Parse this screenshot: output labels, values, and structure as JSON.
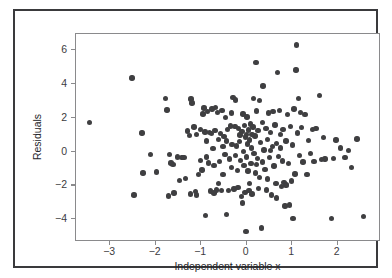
{
  "chart_data": {
    "type": "scatter",
    "title": "",
    "xlabel": "Independent variable x",
    "ylabel": "Residuals",
    "xlim": [
      -3.75,
      2.95
    ],
    "ylim": [
      -5.35,
      6.95
    ],
    "xticks": [
      -3,
      -2,
      -1,
      0,
      1,
      2
    ],
    "xticklabels": [
      "−3",
      "−2",
      "−1",
      "0",
      "1",
      "2"
    ],
    "yticks": [
      -4,
      -2,
      0,
      2,
      4,
      6
    ],
    "yticklabels": [
      "−4",
      "−2",
      "0",
      "2",
      "4",
      "6"
    ],
    "grid": false,
    "legend": null,
    "marker": {
      "shape": "circle",
      "color": "#3f3f41",
      "size_px": 5.4
    },
    "series": [
      {
        "name": "Residuals",
        "points": [
          [
            -3.45,
            1.72
          ],
          [
            -2.52,
            4.35
          ],
          [
            -2.48,
            -2.57
          ],
          [
            -2.3,
            1.1
          ],
          [
            -2.28,
            -1.28
          ],
          [
            -2.12,
            -0.16
          ],
          [
            -1.78,
            3.15
          ],
          [
            -1.75,
            2.45
          ],
          [
            -1.72,
            -2.62
          ],
          [
            -1.7,
            -0.18
          ],
          [
            -1.66,
            -0.68
          ],
          [
            -1.62,
            -0.76
          ],
          [
            -1.6,
            -2.45
          ],
          [
            -1.52,
            -0.32
          ],
          [
            -1.48,
            -1.72
          ],
          [
            -1.42,
            -0.34
          ],
          [
            -1.38,
            -0.35
          ],
          [
            -1.34,
            -1.58
          ],
          [
            -1.3,
            1.22
          ],
          [
            -1.26,
            0.95
          ],
          [
            -1.24,
            -2.52
          ],
          [
            -1.22,
            3.1
          ],
          [
            -1.2,
            2.88
          ],
          [
            -1.16,
            1.45
          ],
          [
            -1.12,
            -2.38
          ],
          [
            -1.1,
            1.0
          ],
          [
            -1.06,
            -1.35
          ],
          [
            -1.02,
            -0.52
          ],
          [
            -0.98,
            -1.1
          ],
          [
            -0.96,
            2.22
          ],
          [
            -0.94,
            2.58
          ],
          [
            -0.92,
            1.16
          ],
          [
            -0.9,
            -3.8
          ],
          [
            -0.88,
            0.62
          ],
          [
            -0.86,
            2.35
          ],
          [
            -0.84,
            -0.68
          ],
          [
            -0.82,
            1.12
          ],
          [
            -0.8,
            -2.34
          ],
          [
            -0.78,
            1.08
          ],
          [
            -0.76,
            2.52
          ],
          [
            -0.74,
            0.18
          ],
          [
            -0.72,
            -0.82
          ],
          [
            -0.7,
            1.26
          ],
          [
            -0.68,
            2.62
          ],
          [
            -0.66,
            -2.28
          ],
          [
            -0.64,
            2.32
          ],
          [
            -0.62,
            0.72
          ],
          [
            -0.6,
            -0.6
          ],
          [
            -0.58,
            1.05
          ],
          [
            -0.56,
            -2.3
          ],
          [
            -0.54,
            2.42
          ],
          [
            -0.52,
            -1.36
          ],
          [
            -0.5,
            0.88
          ],
          [
            -0.48,
            -0.18
          ],
          [
            -0.46,
            2.02
          ],
          [
            -0.44,
            -3.72
          ],
          [
            -0.42,
            1.32
          ],
          [
            -0.4,
            -2.3
          ],
          [
            -0.38,
            -0.45
          ],
          [
            -0.36,
            1.52
          ],
          [
            -0.34,
            -0.95
          ],
          [
            -0.32,
            0.42
          ],
          [
            -0.3,
            3.18
          ],
          [
            -0.28,
            -2.22
          ],
          [
            -0.26,
            1.48
          ],
          [
            -0.25,
            -0.24
          ],
          [
            -0.24,
            3.05
          ],
          [
            -0.22,
            0.32
          ],
          [
            -0.2,
            -1.12
          ],
          [
            -0.19,
            -2.12
          ],
          [
            -0.18,
            1.38
          ],
          [
            -0.16,
            0.58
          ],
          [
            -0.14,
            -0.52
          ],
          [
            -0.12,
            -2.66
          ],
          [
            -0.1,
            1.18
          ],
          [
            -0.09,
            -3.05
          ],
          [
            -0.08,
            2.22
          ],
          [
            -0.07,
            0.02
          ],
          [
            -0.06,
            -0.82
          ],
          [
            -0.05,
            1.55
          ],
          [
            -0.04,
            -2.44
          ],
          [
            -0.03,
            0.85
          ],
          [
            -0.02,
            -4.72
          ],
          [
            -0.01,
            1.02
          ],
          [
            0.0,
            -0.32
          ],
          [
            0.01,
            2.05
          ],
          [
            0.02,
            0.45
          ],
          [
            0.03,
            -1.16
          ],
          [
            0.04,
            1.28
          ],
          [
            0.05,
            -2.32
          ],
          [
            0.06,
            0.68
          ],
          [
            0.08,
            1.62
          ],
          [
            0.09,
            -0.7
          ],
          [
            0.1,
            0.22
          ],
          [
            0.12,
            -2.52
          ],
          [
            0.14,
            1.44
          ],
          [
            0.15,
            3.12
          ],
          [
            0.16,
            -0.1
          ],
          [
            0.18,
            0.92
          ],
          [
            0.19,
            -1.26
          ],
          [
            0.2,
            5.28
          ],
          [
            0.22,
            2.4
          ],
          [
            0.24,
            -0.42
          ],
          [
            0.25,
            1.25
          ],
          [
            0.26,
            -2.18
          ],
          [
            0.28,
            3.02
          ],
          [
            0.3,
            0.52
          ],
          [
            0.32,
            -4.52
          ],
          [
            0.34,
            1.72
          ],
          [
            0.35,
            -0.62
          ],
          [
            0.36,
            3.88
          ],
          [
            0.38,
            0.1
          ],
          [
            0.4,
            -1.05
          ],
          [
            0.42,
            1.38
          ],
          [
            0.44,
            -2.28
          ],
          [
            0.46,
            0.72
          ],
          [
            0.48,
            2.28
          ],
          [
            0.5,
            -0.35
          ],
          [
            0.52,
            1.12
          ],
          [
            0.54,
            -2.58
          ],
          [
            0.56,
            0.3
          ],
          [
            0.58,
            2.38
          ],
          [
            0.6,
            -0.85
          ],
          [
            0.62,
            1.58
          ],
          [
            0.64,
            -1.88
          ],
          [
            0.66,
            0.48
          ],
          [
            0.68,
            4.68
          ],
          [
            0.7,
            -0.28
          ],
          [
            0.72,
            2.42
          ],
          [
            0.74,
            1.02
          ],
          [
            0.76,
            -2.08
          ],
          [
            0.78,
            -0.55
          ],
          [
            0.8,
            1.3
          ],
          [
            0.82,
            -1.82
          ],
          [
            0.84,
            -3.22
          ],
          [
            0.86,
            0.62
          ],
          [
            0.88,
            -1.95
          ],
          [
            0.9,
            2.2
          ],
          [
            0.92,
            -0.72
          ],
          [
            0.94,
            -3.15
          ],
          [
            0.96,
            1.48
          ],
          [
            0.98,
            -1.75
          ],
          [
            1.0,
            0.38
          ],
          [
            1.02,
            -3.95
          ],
          [
            1.04,
            2.52
          ],
          [
            1.06,
            -1.32
          ],
          [
            1.08,
            4.82
          ],
          [
            1.1,
            6.3
          ],
          [
            1.12,
            1.1
          ],
          [
            1.14,
            3.12
          ],
          [
            1.16,
            -0.22
          ],
          [
            1.2,
            1.42
          ],
          [
            1.24,
            -0.62
          ],
          [
            1.28,
            2.18
          ],
          [
            1.32,
            -1.35
          ],
          [
            1.36,
            0.65
          ],
          [
            1.4,
            -0.1
          ],
          [
            1.44,
            1.3
          ],
          [
            1.48,
            -0.58
          ],
          [
            1.52,
            1.35
          ],
          [
            1.6,
            3.32
          ],
          [
            1.64,
            -0.48
          ],
          [
            1.68,
            0.82
          ],
          [
            1.72,
            -0.45
          ],
          [
            1.86,
            -3.95
          ],
          [
            1.9,
            -0.42
          ],
          [
            1.96,
            0.68
          ],
          [
            2.06,
            0.22
          ],
          [
            2.16,
            -0.35
          ],
          [
            2.24,
            0.05
          ],
          [
            2.3,
            -0.95
          ],
          [
            2.42,
            0.75
          ],
          [
            2.56,
            -3.85
          ],
          [
            -1.98,
            -1.22
          ],
          [
            -1.1,
            -2.58
          ],
          [
            -0.52,
            0.28
          ],
          [
            0.28,
            -1.52
          ],
          [
            0.66,
            -2.75
          ],
          [
            1.18,
            2.3
          ],
          [
            -0.72,
            -2.45
          ],
          [
            0.46,
            -1.62
          ],
          [
            -0.34,
            2.28
          ],
          [
            0.86,
            -2.0
          ],
          [
            -0.62,
            -1.9
          ],
          [
            0.12,
            1.02
          ],
          [
            -0.15,
            0.98
          ],
          [
            0.52,
            0.05
          ],
          [
            -0.88,
            -0.32
          ],
          [
            0.22,
            -0.78
          ],
          [
            -0.44,
            0.62
          ],
          [
            0.74,
            0.22
          ],
          [
            -1.02,
            1.32
          ],
          [
            0.06,
            -1.88
          ]
        ]
      }
    ]
  }
}
